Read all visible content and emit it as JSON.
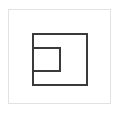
{
  "diagram": {
    "frame": {
      "x": 8,
      "y": 9,
      "width": 103,
      "height": 95,
      "color": "#e2e2e2"
    },
    "shapes": [
      {
        "name": "outer-square",
        "x": 32,
        "y": 33,
        "width": 56,
        "height": 53,
        "stroke": "#3a3a3a"
      },
      {
        "name": "inner-square",
        "x": 32,
        "y": 47,
        "width": 29,
        "height": 25,
        "stroke": "#3a3a3a"
      }
    ]
  }
}
